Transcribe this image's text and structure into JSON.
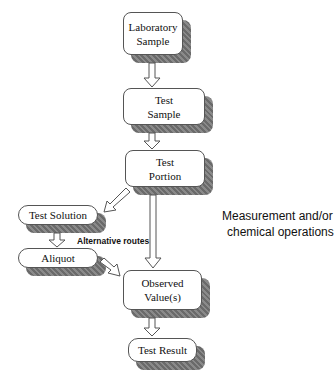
{
  "diagram": {
    "nodes": [
      {
        "id": "lab_sample",
        "line1": "Laboratory",
        "line2": "Sample"
      },
      {
        "id": "test_sample",
        "line1": "Test",
        "line2": "Sample"
      },
      {
        "id": "test_portion",
        "line1": "Test",
        "line2": "Portion"
      },
      {
        "id": "test_solution",
        "line1": "Test Solution"
      },
      {
        "id": "aliquot",
        "line1": "Aliquot"
      },
      {
        "id": "observed_values",
        "line1": "Observed",
        "line2": "Value(s)"
      },
      {
        "id": "test_result",
        "line1": "Test Result"
      }
    ],
    "labels": {
      "alternative_routes": "Alternative routes",
      "measurement_line1": "Measurement and/or",
      "measurement_line2": "chemical operations"
    },
    "colors": {
      "border": "#555555",
      "shadow": "#777777",
      "arrow": "#555555"
    }
  }
}
